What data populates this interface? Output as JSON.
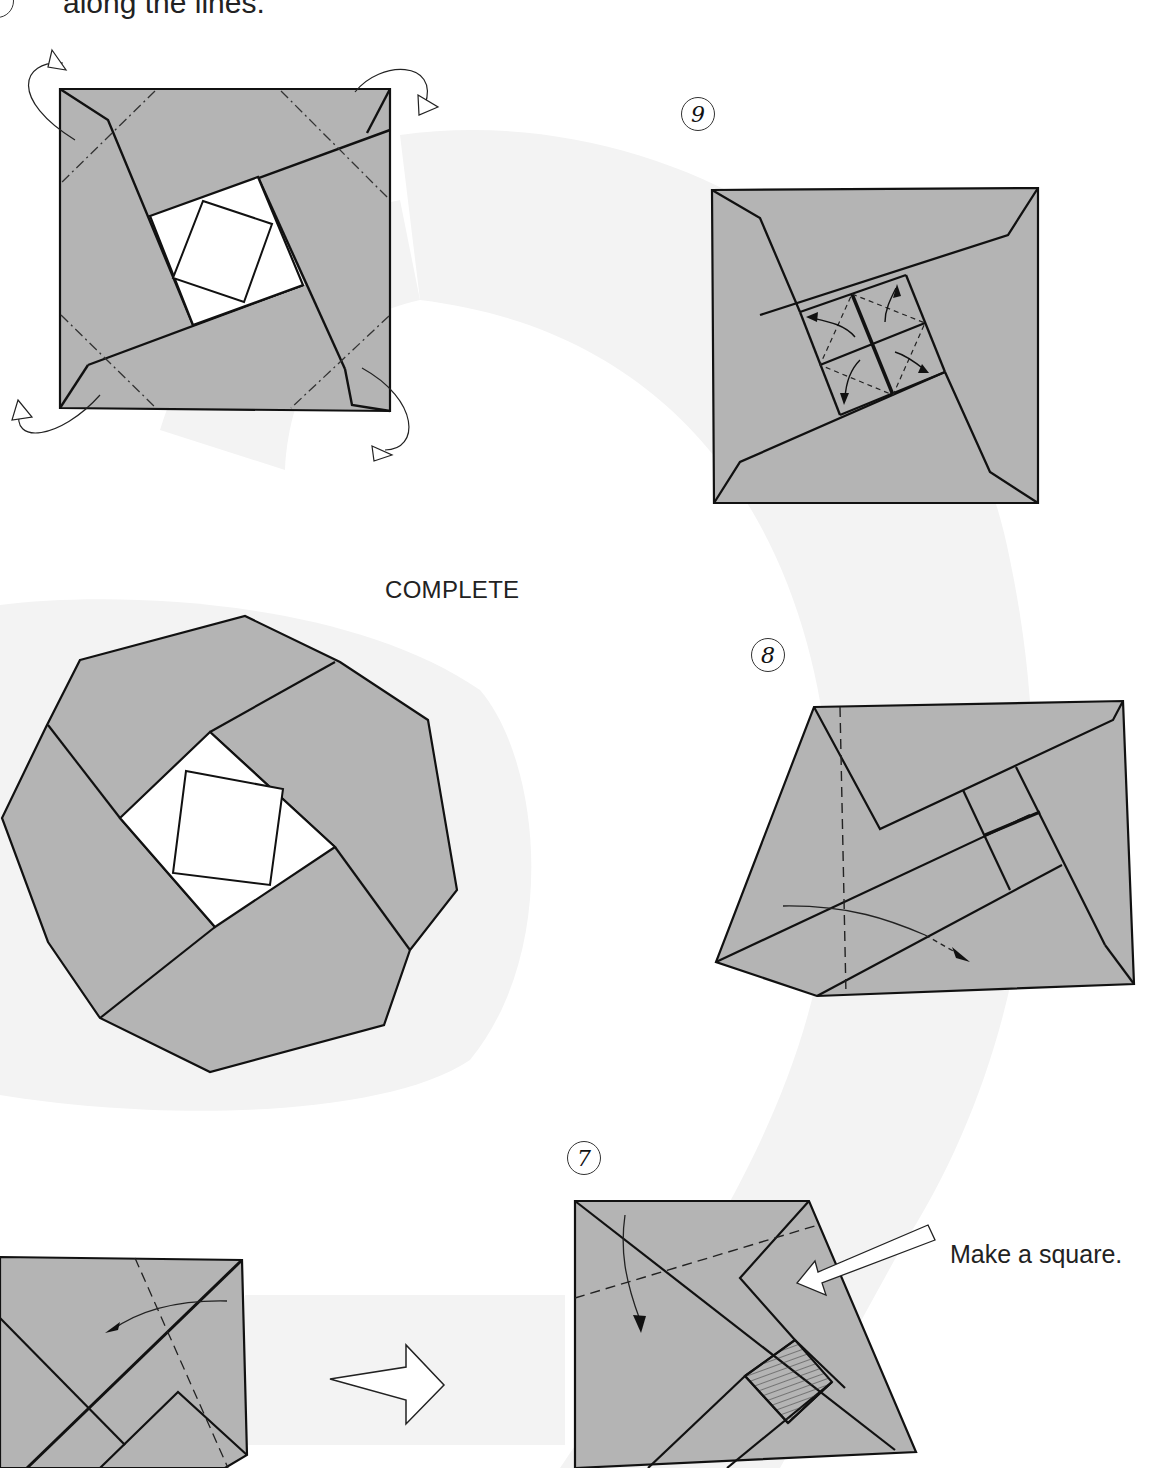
{
  "page": {
    "top_caption": "along the lines.",
    "complete_label": "COMPLETE",
    "colors": {
      "paper_gray": "#b4b4b4",
      "background_swoosh": "#f3f3f3",
      "line": "#111111",
      "white_center": "#ffffff"
    }
  },
  "steps": [
    {
      "id": "previous",
      "number": "",
      "description": "Square with corners to fold behind along dash-dot lines"
    },
    {
      "id": "9",
      "number": "9",
      "description": "Square with central 2x2 grid and swivel arrows"
    },
    {
      "id": "8",
      "number": "8",
      "description": "Quadrilateral with vertical valley fold line and arrow"
    },
    {
      "id": "7",
      "number": "7",
      "description": "Trapezoid with dashed valley fold and hatched square",
      "annotation": "Make a square."
    },
    {
      "id": "6",
      "number": "",
      "description": "Partial diagram at bottom left with curved arrow and dashed line"
    },
    {
      "id": "complete",
      "number": "",
      "description": "Finished octagonal model with white square center"
    }
  ],
  "icons": {
    "transition_arrow": "hollow-right-arrow-icon"
  }
}
